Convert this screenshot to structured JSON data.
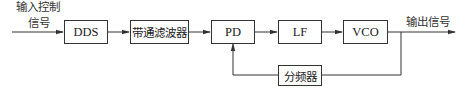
{
  "diagram": {
    "type": "block-diagram",
    "input_label": {
      "line1": "输入控制",
      "line2": "信号"
    },
    "output_label": "输出信号",
    "blocks": [
      {
        "id": "dds",
        "label": "DDS"
      },
      {
        "id": "bpf",
        "label": "带通滤波器"
      },
      {
        "id": "pd",
        "label": "PD"
      },
      {
        "id": "lf",
        "label": "LF"
      },
      {
        "id": "vco",
        "label": "VCO"
      },
      {
        "id": "divider",
        "label": "分频器"
      }
    ],
    "connections": [
      {
        "from": "input",
        "to": "dds"
      },
      {
        "from": "dds",
        "to": "bpf"
      },
      {
        "from": "bpf",
        "to": "pd"
      },
      {
        "from": "pd",
        "to": "lf"
      },
      {
        "from": "lf",
        "to": "vco"
      },
      {
        "from": "vco",
        "to": "output"
      },
      {
        "from": "vco",
        "to": "divider"
      },
      {
        "from": "divider",
        "to": "pd"
      }
    ],
    "colors": {
      "line": "#333333",
      "background": "#ffffff"
    }
  }
}
